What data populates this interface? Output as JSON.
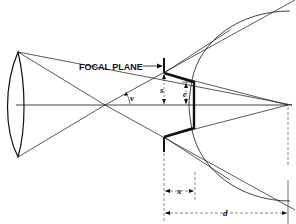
{
  "diagram": {
    "labels": {
      "focal_plane": "FOCAL PLANE",
      "angle": "v",
      "s": "s",
      "c": "c",
      "x": "x",
      "d": "d"
    },
    "colors": {
      "line": "#111111",
      "background": "#ffffff"
    }
  }
}
